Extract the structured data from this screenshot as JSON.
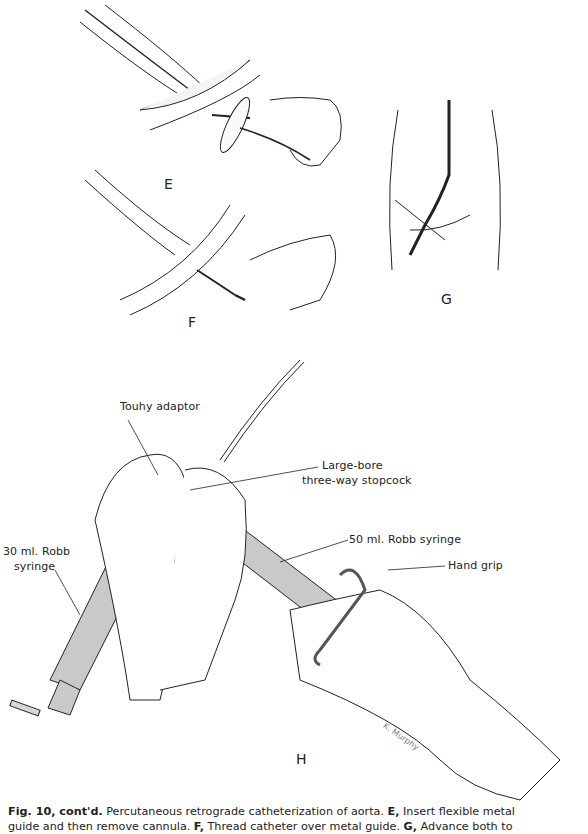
{
  "figure": {
    "panels": [
      {
        "id": "E",
        "label": "E"
      },
      {
        "id": "F",
        "label": "F"
      },
      {
        "id": "G",
        "label": "G"
      },
      {
        "id": "H",
        "label": "H"
      }
    ],
    "callouts": {
      "touhy_adaptor": "Touhy adaptor",
      "stopcock_line1": "Large-bore",
      "stopcock_line2": "three-way stopcock",
      "syringe30_line1": "30 ml. Robb",
      "syringe30_line2": "syringe",
      "syringe50": "50 ml. Robb syringe",
      "hand_grip": "Hand grip"
    },
    "artist_signature": "K. Murphy",
    "colors": {
      "line": "#222222",
      "syringe_fill": "#c9c9c9",
      "vessel_fill": "#f4f4f4"
    }
  },
  "caption": {
    "fig_number": "Fig. 10, cont'd.",
    "text1": " Percutaneous retrograde catheterization of aorta. ",
    "e_label": "E,",
    "e_text": " Insert flexible metal",
    "line2_a": "guide and then remove cannula. ",
    "f_label": "F,",
    "f_text": " Thread catheter over metal guide. ",
    "g_label": "G,",
    "g_text": " Advance both to"
  }
}
